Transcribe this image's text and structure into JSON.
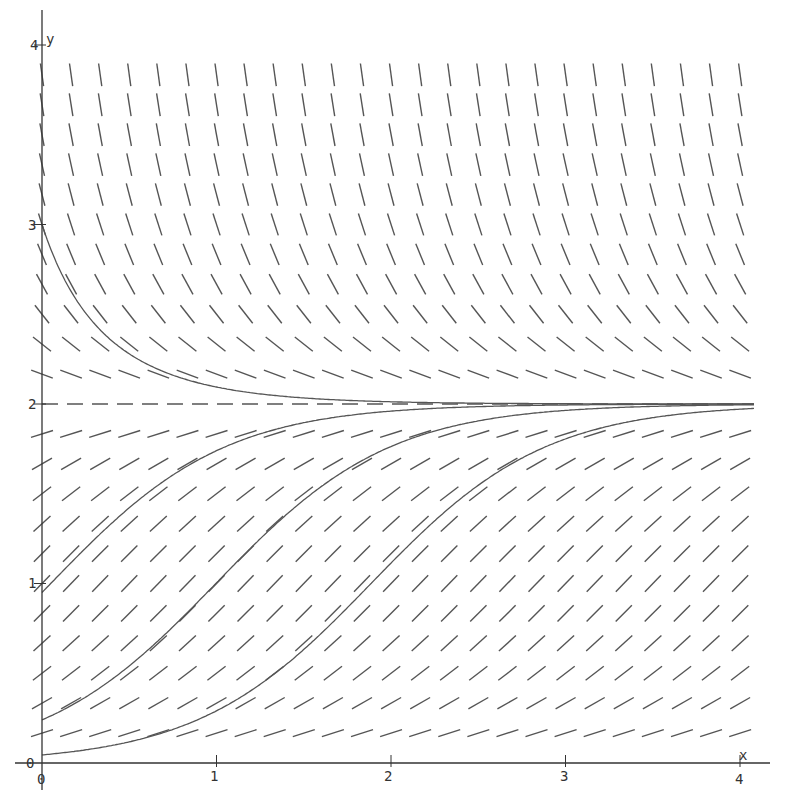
{
  "chart_data": {
    "type": "slope_field",
    "title": "",
    "equation_inferred": "dy/dx = y(2 - y)",
    "xlabel": "x",
    "ylabel": "y",
    "xlim": [
      0,
      4
    ],
    "ylim": [
      0,
      4
    ],
    "x_ticks": [
      0,
      1,
      2,
      3,
      4
    ],
    "y_ticks": [
      0,
      1,
      2,
      3,
      4
    ],
    "x_tick_labels": [
      "0",
      "1",
      "2",
      "3",
      "4"
    ],
    "y_tick_labels": [
      "0",
      "1",
      "2",
      "3",
      "4"
    ],
    "grid": false,
    "equilibrium": {
      "y": 2,
      "style": "dashed"
    },
    "field_grid": {
      "x_step": 0.1667,
      "y_step": 0.1667
    },
    "solution_curves": [
      {
        "name": "decaying",
        "y0": 3.0
      },
      {
        "name": "sigmoid-left",
        "y0": 0.95
      },
      {
        "name": "sigmoid-middle",
        "y0": 0.24
      },
      {
        "name": "sigmoid-right",
        "y0": 0.045
      }
    ],
    "colors": {
      "segments": "#555555",
      "curves": "#555555",
      "axes": "#333333"
    }
  },
  "axes": {
    "x_label": "x",
    "y_label": "y",
    "origin_x_label": "0",
    "origin_y_label": "0",
    "x_tick_labels": [
      "1",
      "2",
      "3",
      "4"
    ],
    "y_tick_labels": [
      "1",
      "2",
      "3",
      "4"
    ]
  }
}
